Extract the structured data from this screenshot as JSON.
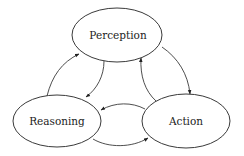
{
  "diagram": {
    "type": "cycle",
    "nodes": [
      {
        "id": "perception",
        "label": "Perception",
        "cx": 117,
        "cy": 35,
        "rx": 45,
        "ry": 27
      },
      {
        "id": "reasoning",
        "label": "Reasoning",
        "cx": 57,
        "cy": 121,
        "rx": 44,
        "ry": 26
      },
      {
        "id": "action",
        "label": "Action",
        "cx": 186,
        "cy": 121,
        "rx": 44,
        "ry": 27
      }
    ],
    "edges": [
      {
        "from": "reasoning",
        "to": "perception"
      },
      {
        "from": "perception",
        "to": "reasoning"
      },
      {
        "from": "perception",
        "to": "action"
      },
      {
        "from": "action",
        "to": "perception"
      },
      {
        "from": "action",
        "to": "reasoning"
      },
      {
        "from": "reasoning",
        "to": "action"
      }
    ],
    "colors": {
      "stroke": "#3a3a3a",
      "text": "#222222",
      "background": "#ffffff"
    }
  }
}
